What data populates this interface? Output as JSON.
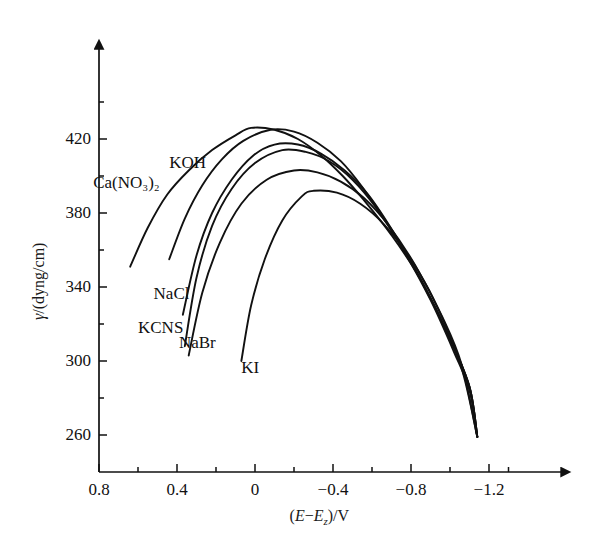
{
  "figure": {
    "background": "#ffffff",
    "ink_color": "#111111",
    "axis_color": "#111111"
  },
  "axes": {
    "x_title_prefix": "(",
    "x_title_e": "E",
    "x_title_minus": "−",
    "x_title_ez": "E",
    "x_title_ez_sub": "z",
    "x_title_suffix": ")/V",
    "y_title_gamma": "γ",
    "y_title_rest": "/(dyng/cm)"
  },
  "chart_data": {
    "type": "line",
    "title": "",
    "xlabel": "(E−Ez)/V",
    "ylabel": "γ/(dyng/cm)",
    "xlim": [
      0.8,
      -1.3
    ],
    "ylim": [
      240,
      440
    ],
    "x_ticks_major": [
      0.8,
      0.4,
      0,
      -0.4,
      -0.8,
      -1.2
    ],
    "x_tick_labels": [
      "0.8",
      "0.4",
      "0",
      "−0.4",
      "−0.8",
      "−1.2"
    ],
    "x_ticks_minor": [
      0.6,
      0.2,
      -0.2,
      -0.6,
      -1.0,
      -1.3
    ],
    "y_ticks_major": [
      420,
      380,
      340,
      300,
      260
    ],
    "y_tick_labels": [
      "420",
      "380",
      "340",
      "300",
      "260"
    ],
    "y_ticks_minor": [
      440,
      400,
      360,
      320,
      280
    ],
    "grid": false,
    "legend": "inline-curve-labels",
    "series": [
      {
        "name": "Ca(NO3)2",
        "label": "Ca(NO₃)₂",
        "label_x_v": 0.83,
        "label_y_gamma": 396,
        "peak": {
          "x_v": 0.02,
          "y_gamma": 426
        },
        "points": [
          {
            "x_v": 0.64,
            "y_gamma": 351
          },
          {
            "x_v": 0.55,
            "y_gamma": 372
          },
          {
            "x_v": 0.45,
            "y_gamma": 390
          },
          {
            "x_v": 0.34,
            "y_gamma": 403
          },
          {
            "x_v": 0.22,
            "y_gamma": 414
          },
          {
            "x_v": 0.1,
            "y_gamma": 422
          },
          {
            "x_v": 0.02,
            "y_gamma": 426
          },
          {
            "x_v": -0.1,
            "y_gamma": 425
          },
          {
            "x_v": -0.22,
            "y_gamma": 420
          },
          {
            "x_v": -0.34,
            "y_gamma": 411
          },
          {
            "x_v": -0.45,
            "y_gamma": 400
          },
          {
            "x_v": -0.55,
            "y_gamma": 388
          },
          {
            "x_v": -0.7,
            "y_gamma": 368
          },
          {
            "x_v": -0.85,
            "y_gamma": 344
          },
          {
            "x_v": -1.0,
            "y_gamma": 312
          },
          {
            "x_v": -1.1,
            "y_gamma": 286
          },
          {
            "x_v": -1.14,
            "y_gamma": 259
          }
        ]
      },
      {
        "name": "KOH",
        "label": "KOH",
        "label_x_v": 0.44,
        "label_y_gamma": 407,
        "peak": {
          "x_v": -0.08,
          "y_gamma": 425
        },
        "points": [
          {
            "x_v": 0.44,
            "y_gamma": 355
          },
          {
            "x_v": 0.36,
            "y_gamma": 377
          },
          {
            "x_v": 0.27,
            "y_gamma": 395
          },
          {
            "x_v": 0.17,
            "y_gamma": 409
          },
          {
            "x_v": 0.06,
            "y_gamma": 419
          },
          {
            "x_v": -0.08,
            "y_gamma": 425
          },
          {
            "x_v": -0.2,
            "y_gamma": 424
          },
          {
            "x_v": -0.32,
            "y_gamma": 418
          },
          {
            "x_v": -0.44,
            "y_gamma": 408
          },
          {
            "x_v": -0.55,
            "y_gamma": 394
          },
          {
            "x_v": -0.7,
            "y_gamma": 371
          },
          {
            "x_v": -0.85,
            "y_gamma": 344
          },
          {
            "x_v": -1.0,
            "y_gamma": 312
          },
          {
            "x_v": -1.1,
            "y_gamma": 286
          },
          {
            "x_v": -1.14,
            "y_gamma": 259
          }
        ]
      },
      {
        "name": "NaCl",
        "label": "NaCl",
        "label_x_v": 0.52,
        "label_y_gamma": 336,
        "peak": {
          "x_v": -0.1,
          "y_gamma": 417
        },
        "points": [
          {
            "x_v": 0.37,
            "y_gamma": 325
          },
          {
            "x_v": 0.3,
            "y_gamma": 357
          },
          {
            "x_v": 0.22,
            "y_gamma": 380
          },
          {
            "x_v": 0.12,
            "y_gamma": 398
          },
          {
            "x_v": 0.01,
            "y_gamma": 411
          },
          {
            "x_v": -0.1,
            "y_gamma": 417
          },
          {
            "x_v": -0.22,
            "y_gamma": 417
          },
          {
            "x_v": -0.34,
            "y_gamma": 412
          },
          {
            "x_v": -0.46,
            "y_gamma": 403
          },
          {
            "x_v": -0.58,
            "y_gamma": 390
          },
          {
            "x_v": -0.72,
            "y_gamma": 368
          },
          {
            "x_v": -0.86,
            "y_gamma": 342
          },
          {
            "x_v": -1.0,
            "y_gamma": 312
          },
          {
            "x_v": -1.1,
            "y_gamma": 286
          },
          {
            "x_v": -1.14,
            "y_gamma": 259
          }
        ]
      },
      {
        "name": "KCNS",
        "label": "KCNS",
        "label_x_v": 0.6,
        "label_y_gamma": 318,
        "peak": {
          "x_v": -0.14,
          "y_gamma": 414
        },
        "points": [
          {
            "x_v": 0.36,
            "y_gamma": 308
          },
          {
            "x_v": 0.3,
            "y_gamma": 345
          },
          {
            "x_v": 0.22,
            "y_gamma": 373
          },
          {
            "x_v": 0.12,
            "y_gamma": 393
          },
          {
            "x_v": 0.0,
            "y_gamma": 407
          },
          {
            "x_v": -0.14,
            "y_gamma": 414
          },
          {
            "x_v": -0.26,
            "y_gamma": 413
          },
          {
            "x_v": -0.38,
            "y_gamma": 408
          },
          {
            "x_v": -0.5,
            "y_gamma": 398
          },
          {
            "x_v": -0.62,
            "y_gamma": 383
          },
          {
            "x_v": -0.76,
            "y_gamma": 360
          },
          {
            "x_v": -0.9,
            "y_gamma": 333
          },
          {
            "x_v": -1.02,
            "y_gamma": 305
          },
          {
            "x_v": -1.1,
            "y_gamma": 284
          },
          {
            "x_v": -1.14,
            "y_gamma": 259
          }
        ]
      },
      {
        "name": "NaBr",
        "label": "NaBr",
        "label_x_v": 0.39,
        "label_y_gamma": 310,
        "peak": {
          "x_v": -0.2,
          "y_gamma": 403
        },
        "points": [
          {
            "x_v": 0.34,
            "y_gamma": 303
          },
          {
            "x_v": 0.27,
            "y_gamma": 337
          },
          {
            "x_v": 0.18,
            "y_gamma": 364
          },
          {
            "x_v": 0.07,
            "y_gamma": 385
          },
          {
            "x_v": -0.06,
            "y_gamma": 398
          },
          {
            "x_v": -0.2,
            "y_gamma": 403
          },
          {
            "x_v": -0.32,
            "y_gamma": 402
          },
          {
            "x_v": -0.44,
            "y_gamma": 397
          },
          {
            "x_v": -0.56,
            "y_gamma": 388
          },
          {
            "x_v": -0.68,
            "y_gamma": 374
          },
          {
            "x_v": -0.82,
            "y_gamma": 352
          },
          {
            "x_v": -0.96,
            "y_gamma": 324
          },
          {
            "x_v": -1.06,
            "y_gamma": 298
          },
          {
            "x_v": -1.14,
            "y_gamma": 259
          }
        ]
      },
      {
        "name": "KI",
        "label": "KI",
        "label_x_v": 0.07,
        "label_y_gamma": 296,
        "peak": {
          "x_v": -0.3,
          "y_gamma": 392
        },
        "points": [
          {
            "x_v": 0.07,
            "y_gamma": 300
          },
          {
            "x_v": 0.02,
            "y_gamma": 330
          },
          {
            "x_v": -0.05,
            "y_gamma": 355
          },
          {
            "x_v": -0.14,
            "y_gamma": 376
          },
          {
            "x_v": -0.24,
            "y_gamma": 389
          },
          {
            "x_v": -0.3,
            "y_gamma": 392
          },
          {
            "x_v": -0.42,
            "y_gamma": 391
          },
          {
            "x_v": -0.54,
            "y_gamma": 385
          },
          {
            "x_v": -0.66,
            "y_gamma": 374
          },
          {
            "x_v": -0.8,
            "y_gamma": 355
          },
          {
            "x_v": -0.94,
            "y_gamma": 328
          },
          {
            "x_v": -1.06,
            "y_gamma": 296
          },
          {
            "x_v": -1.14,
            "y_gamma": 259
          }
        ]
      }
    ]
  }
}
